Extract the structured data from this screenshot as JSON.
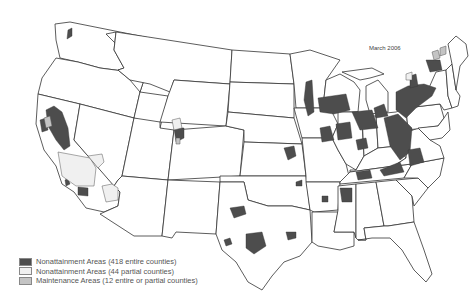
{
  "map": {
    "title": "March 2006",
    "subject": "Ozone nonattainment and maintenance areas, contiguous United States",
    "colors": {
      "nonattainment_entire": "#4d4d4d",
      "nonattainment_partial": "#f0f0f0",
      "maintenance": "#c4c4c4",
      "state_border": "#333333",
      "background": "#ffffff"
    }
  },
  "legend": {
    "items": [
      {
        "label": "Nonattainment Areas (418 entire counties)",
        "swatch": "#4d4d4d"
      },
      {
        "label": "Nonattainment Areas (44 partial counties)",
        "swatch": "#f0f0f0"
      },
      {
        "label": "Maintenance Areas (12 entire or partial counties)",
        "swatch": "#c4c4c4"
      }
    ]
  }
}
